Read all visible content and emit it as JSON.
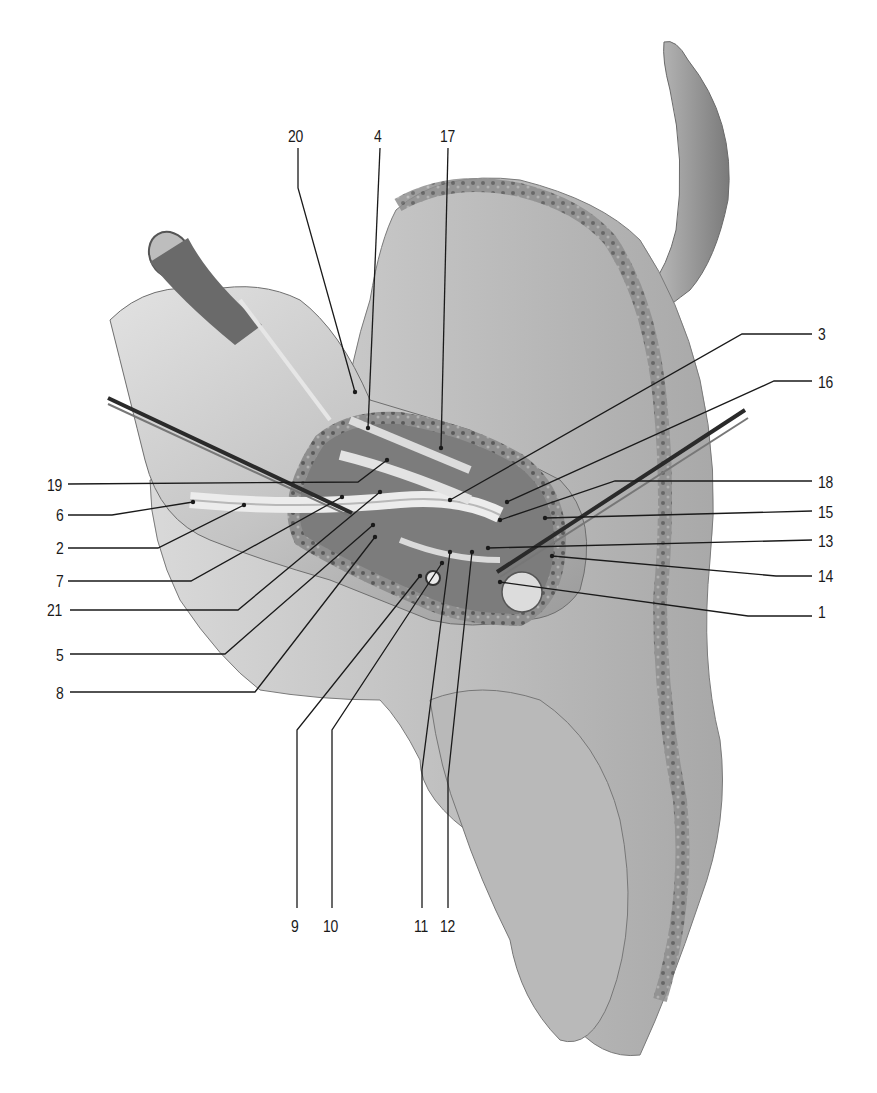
{
  "figure": {
    "background": "#ffffff",
    "ink_color": "#1a1a1a",
    "bone_fill": "#cfcfcf",
    "bone_shadow": "#8c8c8c",
    "cortex_fill": "#9a9a9a"
  },
  "labels": [
    {
      "id": "20",
      "text": "20",
      "x": 288,
      "y": 128,
      "anchor": "top",
      "line": [
        [
          298,
          148
        ],
        [
          298,
          188
        ],
        [
          355,
          392
        ]
      ],
      "dot": [
        355,
        392
      ]
    },
    {
      "id": "4",
      "text": "4",
      "x": 374,
      "y": 128,
      "anchor": "top",
      "line": [
        [
          380,
          148
        ],
        [
          368,
          428
        ]
      ],
      "dot": [
        368,
        428
      ]
    },
    {
      "id": "17",
      "text": "17",
      "x": 440,
      "y": 128,
      "anchor": "top",
      "line": [
        [
          448,
          148
        ],
        [
          441,
          448
        ]
      ],
      "dot": [
        441,
        448
      ]
    },
    {
      "id": "3",
      "text": "3",
      "x": 818,
      "y": 326,
      "anchor": "right",
      "line": [
        [
          812,
          334
        ],
        [
          742,
          334
        ],
        [
          450,
          500
        ]
      ],
      "dot": [
        450,
        500
      ]
    },
    {
      "id": "16",
      "text": "16",
      "x": 818,
      "y": 374,
      "anchor": "right",
      "line": [
        [
          812,
          381
        ],
        [
          774,
          381
        ],
        [
          507,
          502
        ]
      ],
      "dot": [
        507,
        502
      ]
    },
    {
      "id": "18",
      "text": "18",
      "x": 818,
      "y": 474,
      "anchor": "right",
      "line": [
        [
          812,
          481
        ],
        [
          615,
          481
        ],
        [
          500,
          520
        ]
      ],
      "dot": [
        500,
        520
      ]
    },
    {
      "id": "15",
      "text": "15",
      "x": 818,
      "y": 504,
      "anchor": "right",
      "line": [
        [
          812,
          511
        ],
        [
          545,
          518
        ]
      ],
      "dot": [
        545,
        518
      ]
    },
    {
      "id": "13",
      "text": "13",
      "x": 818,
      "y": 533,
      "anchor": "right",
      "line": [
        [
          812,
          540
        ],
        [
          488,
          548
        ]
      ],
      "dot": [
        488,
        548
      ]
    },
    {
      "id": "14",
      "text": "14",
      "x": 818,
      "y": 568,
      "anchor": "right",
      "line": [
        [
          812,
          576
        ],
        [
          776,
          576
        ],
        [
          552,
          556
        ]
      ],
      "dot": [
        552,
        556
      ]
    },
    {
      "id": "1",
      "text": "1",
      "x": 818,
      "y": 604,
      "anchor": "right",
      "line": [
        [
          812,
          616
        ],
        [
          748,
          616
        ],
        [
          500,
          582
        ]
      ],
      "dot": [
        500,
        582
      ]
    },
    {
      "id": "19",
      "text": "19",
      "x": 47,
      "y": 477,
      "anchor": "left",
      "line": [
        [
          68,
          484
        ],
        [
          358,
          482
        ],
        [
          387,
          460
        ]
      ],
      "dot": [
        387,
        460
      ]
    },
    {
      "id": "6",
      "text": "6",
      "x": 56,
      "y": 507,
      "anchor": "left",
      "line": [
        [
          68,
          515
        ],
        [
          112,
          515
        ],
        [
          193,
          502
        ]
      ],
      "dot": [
        193,
        502
      ]
    },
    {
      "id": "2",
      "text": "2",
      "x": 56,
      "y": 540,
      "anchor": "left",
      "line": [
        [
          68,
          548
        ],
        [
          158,
          548
        ],
        [
          244,
          505
        ]
      ],
      "dot": [
        244,
        505
      ]
    },
    {
      "id": "7",
      "text": "7",
      "x": 56,
      "y": 573,
      "anchor": "left",
      "line": [
        [
          68,
          581
        ],
        [
          191,
          581
        ],
        [
          342,
          497
        ]
      ],
      "dot": [
        342,
        497
      ]
    },
    {
      "id": "21",
      "text": "21",
      "x": 47,
      "y": 602,
      "anchor": "left",
      "line": [
        [
          70,
          610
        ],
        [
          238,
          610
        ],
        [
          380,
          492
        ]
      ],
      "dot": [
        380,
        492
      ]
    },
    {
      "id": "5",
      "text": "5",
      "x": 56,
      "y": 647,
      "anchor": "left",
      "line": [
        [
          70,
          654
        ],
        [
          225,
          654
        ],
        [
          373,
          525
        ]
      ],
      "dot": [
        373,
        525
      ]
    },
    {
      "id": "8",
      "text": "8",
      "x": 56,
      "y": 685,
      "anchor": "left",
      "line": [
        [
          70,
          692
        ],
        [
          255,
          692
        ],
        [
          375,
          537
        ]
      ],
      "dot": [
        375,
        537
      ]
    },
    {
      "id": "9",
      "text": "9",
      "x": 291,
      "y": 918,
      "anchor": "bottom",
      "line": [
        [
          297,
          908
        ],
        [
          297,
          730
        ],
        [
          420,
          576
        ]
      ],
      "dot": [
        420,
        576
      ]
    },
    {
      "id": "10",
      "text": "10",
      "x": 323,
      "y": 918,
      "anchor": "bottom",
      "line": [
        [
          332,
          908
        ],
        [
          332,
          730
        ],
        [
          442,
          563
        ]
      ],
      "dot": [
        442,
        563
      ]
    },
    {
      "id": "11",
      "text": "11",
      "x": 414,
      "y": 918,
      "anchor": "bottom",
      "line": [
        [
          422,
          908
        ],
        [
          422,
          770
        ],
        [
          450,
          552
        ]
      ],
      "dot": [
        450,
        552
      ]
    },
    {
      "id": "12",
      "text": "12",
      "x": 440,
      "y": 918,
      "anchor": "bottom",
      "line": [
        [
          448,
          908
        ],
        [
          448,
          778
        ],
        [
          472,
          552
        ]
      ],
      "dot": [
        472,
        552
      ]
    }
  ]
}
